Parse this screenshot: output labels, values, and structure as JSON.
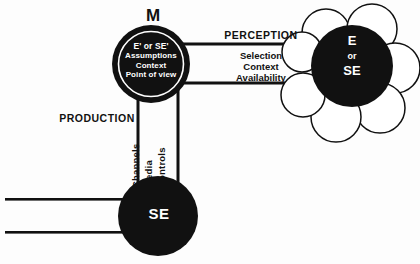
{
  "diagram": {
    "background_color": "#fdfdfd",
    "ink_color": "#111111",
    "paper_color": "#ffffff",
    "title_label": "M",
    "nodes": {
      "m_node": {
        "name": "M",
        "lines": [
          "E' or SE'",
          "Assumptions",
          "Context",
          "Point of view"
        ],
        "line0": "E' or SE'",
        "line1": "Assumptions",
        "line2": "Context",
        "line3": "Point of view"
      },
      "ese_node": {
        "line0": "E",
        "line1": "or",
        "line2": "SE"
      },
      "se_node": {
        "label": "SE"
      }
    },
    "channels": {
      "perception": {
        "title": "PERCEPTION",
        "item0": "Selection",
        "item1": "Context",
        "item2": "Availability",
        "items": [
          "Selection",
          "Context",
          "Availability"
        ]
      },
      "production": {
        "title": "PRODUCTION",
        "item0": "Channels",
        "item1": "Media",
        "item2": "Controls",
        "items": [
          "Channels",
          "Media",
          "Controls"
        ]
      }
    }
  }
}
